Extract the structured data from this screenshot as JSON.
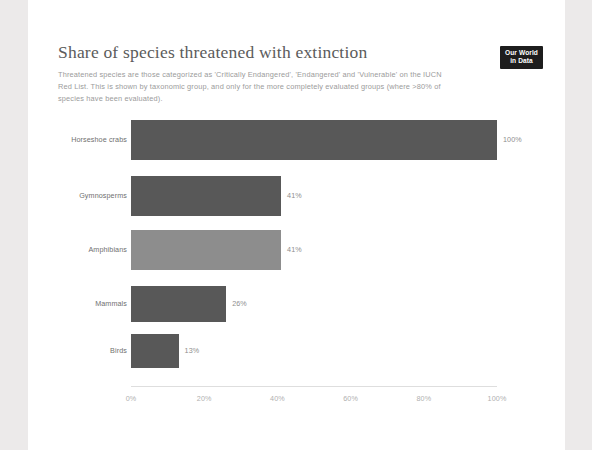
{
  "header": {
    "title": "Share of species threatened with extinction",
    "subtitle": "Threatened species are those categorized as 'Critically Endangered', 'Endangered' and 'Vulnerable' on the IUCN Red List. This is shown by taxonomic group, and only for the more completely evaluated groups (where >80% of species have been evaluated).",
    "logo_line1": "Our World",
    "logo_line2": "in Data"
  },
  "colors": {
    "bar_default": "#585858",
    "bar_highlight": "#8d8d8d",
    "card_background": "#ffffff",
    "page_background": "#eceaea",
    "title_text": "#5b5b5b",
    "subtitle_text": "#9b9b9b",
    "axis_line": "#dedede",
    "tick_text": "#b0b0b0",
    "value_text": "#8e8e8e",
    "category_text": "#6f6f6f",
    "logo_background": "#1d1d1d"
  },
  "chart_data": {
    "type": "bar",
    "orientation": "horizontal",
    "title": "Share of species threatened with extinction",
    "subtitle": "Threatened species are those categorized as 'Critically Endangered', 'Endangered' and 'Vulnerable' on the IUCN Red List. This is shown by taxonomic group, and only for the more completely evaluated groups (where >80% of species have been evaluated).",
    "xlabel": "",
    "ylabel": "",
    "xlim": [
      0,
      100
    ],
    "grid": false,
    "legend": false,
    "categories": [
      "Horseshoe crabs",
      "Gymnosperms",
      "Amphibians",
      "Mammals",
      "Birds"
    ],
    "values": [
      100,
      41,
      41,
      26,
      13
    ],
    "value_labels": [
      "100%",
      "41%",
      "41%",
      "26%",
      "13%"
    ],
    "bar_colors": [
      "#585858",
      "#585858",
      "#8d8d8d",
      "#585858",
      "#585858"
    ],
    "xticks": [
      0,
      20,
      40,
      60,
      80,
      100
    ],
    "xtick_labels": [
      "0%",
      "20%",
      "40%",
      "60%",
      "80%",
      "100%"
    ]
  }
}
